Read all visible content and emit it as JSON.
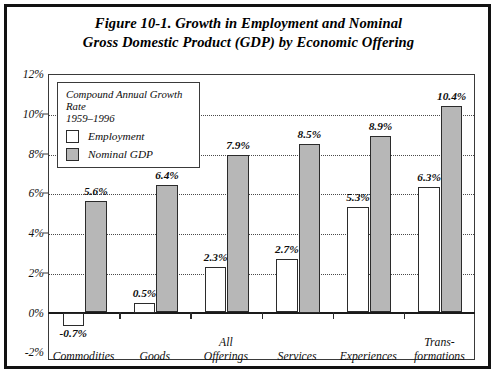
{
  "figure": {
    "title_line1": "Figure 10-1. Growth in Employment and Nominal",
    "title_line2": "Gross Domestic Product (GDP) by Economic Offering"
  },
  "legend": {
    "title_line1": "Compound Annual Growth Rate",
    "title_line2": "1959–1996",
    "items": [
      {
        "label": "Employment",
        "color": "#ffffff"
      },
      {
        "label": "Nominal GDP",
        "color": "#b7b7b7"
      }
    ]
  },
  "chart_data": {
    "type": "bar",
    "title": "Figure 10-1. Growth in Employment and Nominal Gross Domestic Product (GDP) by Economic Offering",
    "subtitle": "Compound Annual Growth Rate 1959–1996",
    "xlabel": "",
    "ylabel": "",
    "ylim": [
      -2,
      12
    ],
    "ytick_labels": [
      "12%",
      "10%",
      "8%",
      "6%",
      "4%",
      "2%",
      "0%",
      "-2%"
    ],
    "ytick_values": [
      12,
      10,
      8,
      6,
      4,
      2,
      0,
      -2
    ],
    "grid": true,
    "legend_position": "top-left",
    "categories": [
      "Commodities",
      "Goods",
      "All Offerings",
      "Services",
      "Experiences",
      "Trans-formations"
    ],
    "category_lines": [
      [
        "",
        "Commodities"
      ],
      [
        "",
        "Goods"
      ],
      [
        "All",
        "Offerings"
      ],
      [
        "",
        "Services"
      ],
      [
        "",
        "Experiences"
      ],
      [
        "Trans-",
        "formations"
      ]
    ],
    "series": [
      {
        "name": "Employment",
        "values": [
          -0.7,
          0.5,
          2.3,
          2.7,
          5.3,
          6.3
        ],
        "labels": [
          "-0.7%",
          "0.5%",
          "2.3%",
          "2.7%",
          "5.3%",
          "6.3%"
        ],
        "color": "#ffffff"
      },
      {
        "name": "Nominal GDP",
        "values": [
          5.6,
          6.4,
          7.9,
          8.5,
          8.9,
          10.4
        ],
        "labels": [
          "5.6%",
          "6.4%",
          "7.9%",
          "8.5%",
          "8.9%",
          "10.4%"
        ],
        "color": "#b7b7b7"
      }
    ]
  }
}
